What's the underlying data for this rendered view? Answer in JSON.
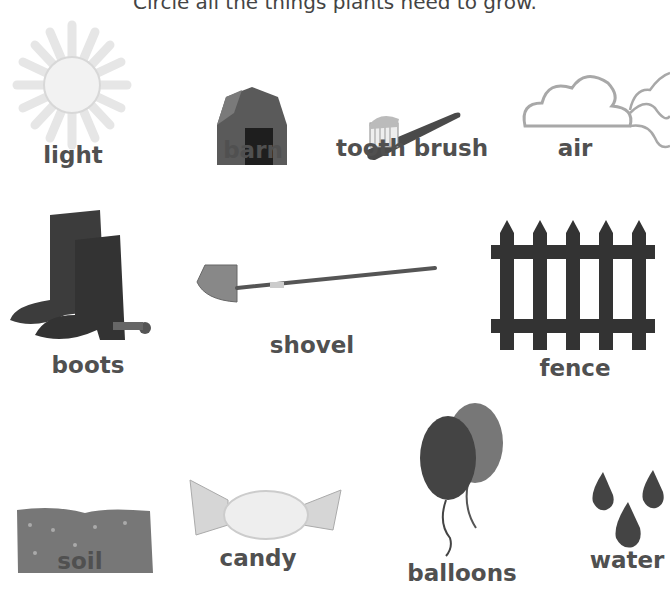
{
  "worksheet": {
    "instruction": "Circle all the things plants need to grow.",
    "items": [
      {
        "id": "light",
        "label": "light"
      },
      {
        "id": "barn",
        "label": "barn"
      },
      {
        "id": "tooth-brush",
        "label": "tooth brush"
      },
      {
        "id": "air",
        "label": "air"
      },
      {
        "id": "boots",
        "label": "boots"
      },
      {
        "id": "shovel",
        "label": "shovel"
      },
      {
        "id": "fence",
        "label": "fence"
      },
      {
        "id": "soil",
        "label": "soil"
      },
      {
        "id": "candy",
        "label": "candy"
      },
      {
        "id": "balloons",
        "label": "balloons"
      },
      {
        "id": "water",
        "label": "water"
      }
    ]
  },
  "colors": {
    "text": "#505050",
    "sun": "#e8e8e8",
    "dark": "#3a3a3a",
    "mid": "#6a6a6a"
  }
}
